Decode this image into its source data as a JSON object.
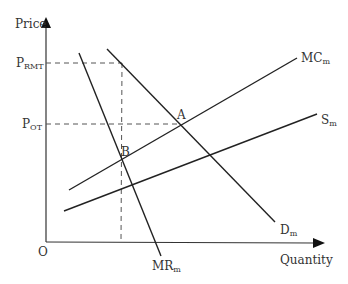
{
  "diagram": {
    "axes": {
      "y_label": "Price",
      "x_label": "Quantity",
      "origin_label": "O"
    },
    "price_levels": [
      {
        "main": "P",
        "sub": "RMT"
      },
      {
        "main": "P",
        "sub": "OT"
      }
    ],
    "curves": [
      {
        "main": "MC",
        "sub": "m"
      },
      {
        "main": "S",
        "sub": "m"
      },
      {
        "main": "D",
        "sub": "m"
      },
      {
        "main": "MR",
        "sub": "m"
      }
    ],
    "points": [
      {
        "label": "A"
      },
      {
        "label": "B"
      }
    ],
    "colors": {
      "line": "#222222",
      "dashed": "#555555",
      "text": "#333333"
    }
  }
}
